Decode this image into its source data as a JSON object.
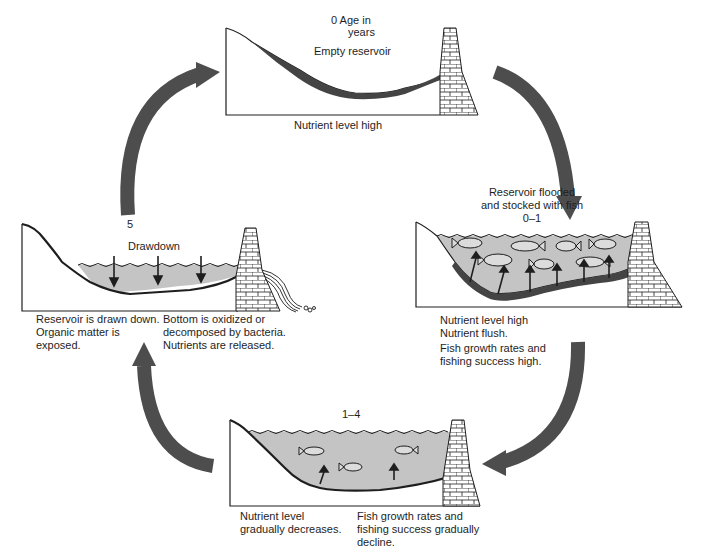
{
  "figure": {
    "colors": {
      "water": "#c4c4c4",
      "sediment": "#444444",
      "arrow": "#4d4d4d",
      "outline": "#1e1e1e",
      "background": "#ffffff"
    }
  },
  "panels": {
    "stage0": {
      "age_label": "0   Age in",
      "age_label_2": "years",
      "title": "Empty reservoir",
      "caption": "Nutrient level high"
    },
    "stage0_1": {
      "title_line1": "Reservoir flooded",
      "title_line2": "and stocked with fish",
      "age_label": "0–1",
      "caption_lines": [
        "Nutrient level high",
        "Nutrient flush.",
        "Fish growth rates and",
        "fishing success high."
      ]
    },
    "stage1_4": {
      "age_label": "1–4",
      "caption_left_lines": [
        "Nutrient level",
        "gradually decreases."
      ],
      "caption_right_lines": [
        "Fish growth rates and",
        "fishing success gradually",
        "decline."
      ]
    },
    "stage5": {
      "age_label": "5",
      "title": "Drawdown",
      "caption_left_lines": [
        "Reservoir is drawn down.",
        "Organic matter is exposed."
      ],
      "caption_right_lines": [
        "Bottom is oxidized or",
        "decomposed by bacteria.",
        "Nutrients are released."
      ]
    }
  },
  "cycle_arrows": [
    {
      "from": "stage0",
      "to": "stage0_1",
      "direction": "clockwise"
    },
    {
      "from": "stage0_1",
      "to": "stage1_4",
      "direction": "clockwise"
    },
    {
      "from": "stage1_4",
      "to": "stage5",
      "direction": "clockwise"
    },
    {
      "from": "stage5",
      "to": "stage0",
      "direction": "clockwise"
    }
  ]
}
